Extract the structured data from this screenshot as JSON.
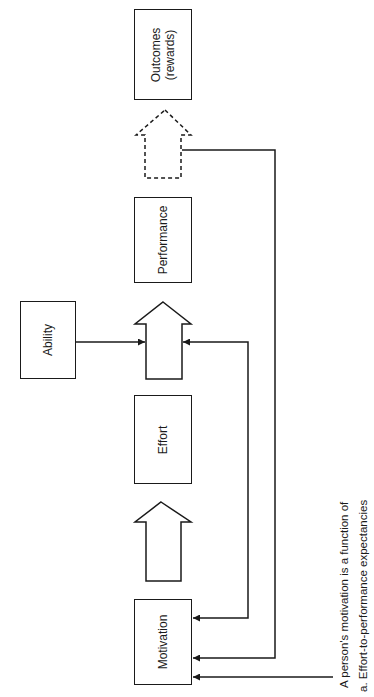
{
  "diagram": {
    "type": "flow",
    "orientation": "rotated -90deg (flow runs bottom-to-top)",
    "nodes": [
      {
        "id": "motivation",
        "label": "Motivation"
      },
      {
        "id": "effort",
        "label": "Effort"
      },
      {
        "id": "performance",
        "label": "Performance"
      },
      {
        "id": "outcomes",
        "label_line1": "Outcomes",
        "label_line2": "(rewards)"
      },
      {
        "id": "ability",
        "label": "Ability"
      }
    ],
    "edges": [
      {
        "from": "motivation",
        "to": "effort",
        "style": "block-arrow-solid"
      },
      {
        "from": "effort",
        "to": "performance",
        "style": "block-arrow-solid"
      },
      {
        "from": "performance",
        "to": "outcomes",
        "style": "block-arrow-dashed"
      },
      {
        "from": "ability",
        "to": "effort-performance-arrow",
        "style": "line-arrow"
      },
      {
        "from": "effort-performance-arrow",
        "to": "motivation",
        "style": "feedback-line"
      },
      {
        "from": "performance-outcomes-arrow",
        "to": "motivation",
        "style": "feedback-line"
      },
      {
        "from": "note",
        "to": "motivation",
        "style": "line-arrow"
      }
    ]
  },
  "note": {
    "line1": "A person's motivation is a function of",
    "line2": "a.  Effort-to-performance expectancies"
  },
  "colors": {
    "stroke": "#1a1a1a",
    "background": "#ffffff"
  }
}
